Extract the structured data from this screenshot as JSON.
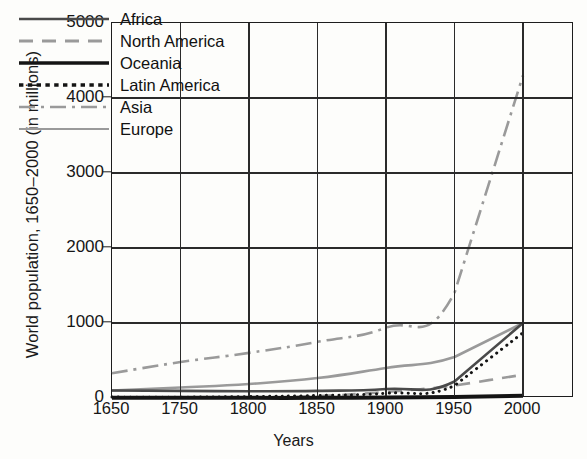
{
  "chart_data": {
    "type": "line",
    "title": "",
    "xlabel": "Years",
    "ylabel": "World population, 1650–2000 (in millions)",
    "categories": [
      "1650",
      "1750",
      "1800",
      "1850",
      "1900",
      "1950",
      "2000"
    ],
    "x_tick_labels": [
      "1650",
      "1750",
      "1800",
      "1850",
      "1900",
      "1950",
      "2000"
    ],
    "y_tick_labels": [
      "0",
      "1000",
      "2000",
      "3000",
      "4000",
      "5000"
    ],
    "ylim": [
      0,
      5000
    ],
    "y_ticks": [
      0,
      1000,
      2000,
      3000,
      4000,
      5000
    ],
    "grid": "both",
    "legend_position": "top-left-inside",
    "series": [
      {
        "name": "Africa",
        "style": "solid",
        "color": "#4a4a4a",
        "width": 2.6,
        "values": [
          100,
          95,
          90,
          95,
          120,
          220,
          1000
        ]
      },
      {
        "name": "North America",
        "style": "dashed",
        "color": "#9a9a9a",
        "width": 2.6,
        "values": [
          5,
          5,
          10,
          26,
          81,
          166,
          310
        ]
      },
      {
        "name": "Oceania",
        "style": "solid",
        "color": "#141414",
        "width": 4.0,
        "values": [
          2,
          2,
          2,
          2,
          6,
          13,
          30
        ]
      },
      {
        "name": "Latin America",
        "style": "dotted",
        "color": "#141414",
        "width": 3.0,
        "values": [
          12,
          11,
          19,
          33,
          63,
          165,
          870
        ]
      },
      {
        "name": "Asia",
        "style": "dashdot",
        "color": "#9a9a9a",
        "width": 2.6,
        "values": [
          330,
          479,
          602,
          749,
          937,
          1402,
          4300
        ]
      },
      {
        "name": "Europe",
        "style": "solid",
        "color": "#9a9a9a",
        "width": 2.6,
        "values": [
          100,
          140,
          187,
          266,
          401,
          547,
          1000
        ]
      }
    ],
    "legend": [
      {
        "label": "Africa",
        "style": "solid",
        "color": "#4a4a4a",
        "width": 2.6
      },
      {
        "label": "North America",
        "style": "dashed",
        "color": "#9a9a9a",
        "width": 2.8
      },
      {
        "label": "Oceania",
        "style": "solid",
        "color": "#141414",
        "width": 3.4
      },
      {
        "label": "Latin America",
        "style": "dotted",
        "color": "#141414",
        "width": 3.4
      },
      {
        "label": "Asia",
        "style": "dashdot",
        "color": "#9a9a9a",
        "width": 2.6
      },
      {
        "label": "Europe",
        "style": "solid",
        "color": "#9a9a9a",
        "width": 2.2
      }
    ],
    "colors": {
      "axis": "#1d1d1d",
      "grid": "#2a2a2a",
      "background": "#fdfdfb",
      "text": "#111111"
    }
  }
}
